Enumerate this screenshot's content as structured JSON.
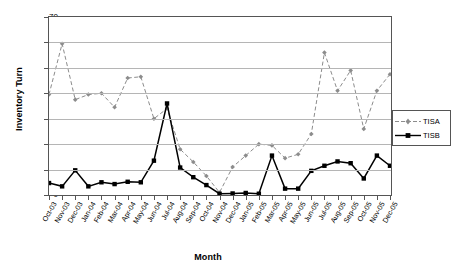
{
  "chart_data": {
    "type": "line",
    "title": "",
    "xlabel": "Month",
    "ylabel": "Inventory Turn",
    "ylim": [
      0,
      70
    ],
    "ytick_step": 10,
    "yticks": [
      0,
      10,
      20,
      30,
      40,
      50,
      60,
      70
    ],
    "grid": true,
    "legend_position": "right",
    "categories": [
      "Oct-03",
      "Nov-03",
      "Dec-03",
      "Jan-04",
      "Feb-04",
      "Mar-04",
      "Apr-04",
      "May-04",
      "Jun-04",
      "Jul-04",
      "Aug-04",
      "Sep-04",
      "Oct-04",
      "Nov-04",
      "Dec-04",
      "Jan-05",
      "Feb-05",
      "Mar-05",
      "Apr-05",
      "May-05",
      "Jun-05",
      "Jul-05",
      "Aug-05",
      "Sep-05",
      "Oct-05",
      "Nov-05",
      "Dec-05"
    ],
    "series": [
      {
        "name": "TISA",
        "color": "#8c8c8c",
        "line_style": "dashed",
        "marker": "diamond",
        "values": [
          39.5,
          59.5,
          37.5,
          39.5,
          40.0,
          34.5,
          46.0,
          46.5,
          30.0,
          34.0,
          18.0,
          13.0,
          7.5,
          1.0,
          11.0,
          15.5,
          20.0,
          19.5,
          14.5,
          16.0,
          24.0,
          56.0,
          41.0,
          49.0,
          26.0,
          41.0,
          47.5
        ]
      },
      {
        "name": "TISB",
        "color": "#000000",
        "line_style": "solid",
        "marker": "square",
        "values": [
          4.7,
          3.4,
          9.7,
          3.4,
          5.0,
          4.3,
          5.2,
          5.0,
          13.5,
          36.0,
          10.8,
          7.0,
          3.9,
          0.5,
          0.6,
          0.8,
          0.5,
          15.5,
          2.5,
          2.5,
          9.5,
          11.5,
          13.2,
          12.5,
          6.5,
          15.5,
          11.5
        ]
      }
    ]
  },
  "legend": {
    "entries": [
      {
        "label": "TISA"
      },
      {
        "label": "TISB"
      }
    ]
  }
}
